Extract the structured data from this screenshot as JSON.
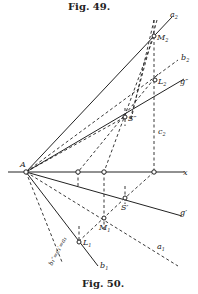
{
  "figure_top": {
    "caption": "Fig. 49."
  },
  "figure_bottom": {
    "caption": "Fig. 50."
  },
  "diagram": {
    "origin": {
      "label": "A",
      "x": 26,
      "y": 172
    },
    "axis": {
      "label": "x",
      "from": [
        8,
        172
      ],
      "to": [
        188,
        172
      ]
    },
    "lines": [
      {
        "name": "a2",
        "label": "a₂",
        "style": "solid",
        "to": [
          172,
          16
        ]
      },
      {
        "name": "b2",
        "label": "b₂",
        "style": "dashed",
        "to": [
          180,
          58
        ]
      },
      {
        "name": "g-double-prime",
        "label": "g″",
        "style": "solid",
        "to": [
          186,
          78
        ]
      },
      {
        "name": "g-prime",
        "label": "g′",
        "style": "solid",
        "to": [
          184,
          216
        ]
      },
      {
        "name": "a1",
        "label": "a₁",
        "style": "dashed",
        "to": [
          178,
          266
        ]
      },
      {
        "name": "b1",
        "label": "b₁",
        "style": "solid",
        "to": [
          100,
          268
        ]
      },
      {
        "name": "b1-dashed",
        "label": "b₁″=c₁′=a₁",
        "style": "dashed",
        "to": [
          50,
          270
        ]
      }
    ],
    "points": [
      {
        "name": "M2",
        "label": "M₂",
        "x": 154,
        "y": 36
      },
      {
        "name": "L2",
        "label": "L₂",
        "x": 155,
        "y": 80
      },
      {
        "name": "S-double-prime",
        "label": "S″",
        "x": 125,
        "y": 117
      },
      {
        "name": "S-prime",
        "label": "S′",
        "x": 125,
        "y": 198
      },
      {
        "name": "M1",
        "label": "M₁",
        "x": 104,
        "y": 218
      },
      {
        "name": "L1",
        "label": "L₁",
        "x": 79,
        "y": 242
      },
      {
        "name": "x-point-1",
        "label": "",
        "x": 78,
        "y": 172
      },
      {
        "name": "x-point-2",
        "label": "",
        "x": 104,
        "y": 172
      },
      {
        "name": "x-point-3",
        "label": "",
        "x": 154,
        "y": 172
      }
    ],
    "labels": {
      "A": "A",
      "x": "x",
      "a2": "a",
      "a2_sub": "2",
      "b2": "b",
      "b2_sub": "2",
      "g2": "g",
      "g2_mark": "″",
      "M2": "M",
      "M2_sub": "2",
      "L2": "L",
      "L2_sub": "2",
      "S2": "S",
      "S2_mark": "″",
      "c2": "c",
      "c2_sub": "2",
      "g1": "g",
      "g1_mark": "′",
      "S1": "S",
      "S1_mark": "′",
      "M1": "M",
      "M1_sub": "1",
      "L1": "L",
      "L1_sub": "1",
      "a1": "a",
      "a1_sub": "1",
      "b1": "b",
      "b1_sub": "1",
      "b1c1a1": "b₁″=c₁′=a₁"
    }
  }
}
